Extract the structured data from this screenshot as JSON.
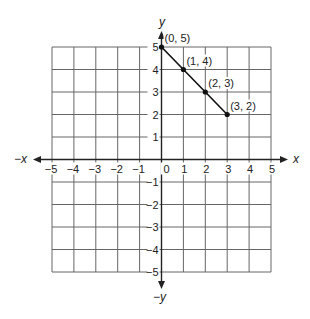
{
  "chart_data": {
    "type": "line",
    "title": "",
    "xlabel": "x",
    "ylabel": "y",
    "x_neg_label": "−x",
    "y_neg_label": "−y",
    "xlim": [
      -5,
      5
    ],
    "ylim": [
      -5,
      5
    ],
    "grid": true,
    "x_ticks": [
      "−5",
      "−4",
      "−3",
      "−2",
      "−1",
      "0",
      "1",
      "2",
      "3",
      "4",
      "5"
    ],
    "y_ticks": [
      "5",
      "4",
      "3",
      "2",
      "1",
      "−1",
      "−2",
      "−3",
      "−4",
      "−5"
    ],
    "series": [
      {
        "name": "line segment",
        "points": [
          {
            "x": 0,
            "y": 5,
            "label": "(0, 5)"
          },
          {
            "x": 1,
            "y": 4,
            "label": "(1, 4)"
          },
          {
            "x": 2,
            "y": 3,
            "label": "(2, 3)"
          },
          {
            "x": 3,
            "y": 2,
            "label": "(3, 2)"
          }
        ]
      }
    ],
    "colors": {
      "grid": "#666666",
      "axis": "#222222",
      "line": "#111111"
    }
  }
}
